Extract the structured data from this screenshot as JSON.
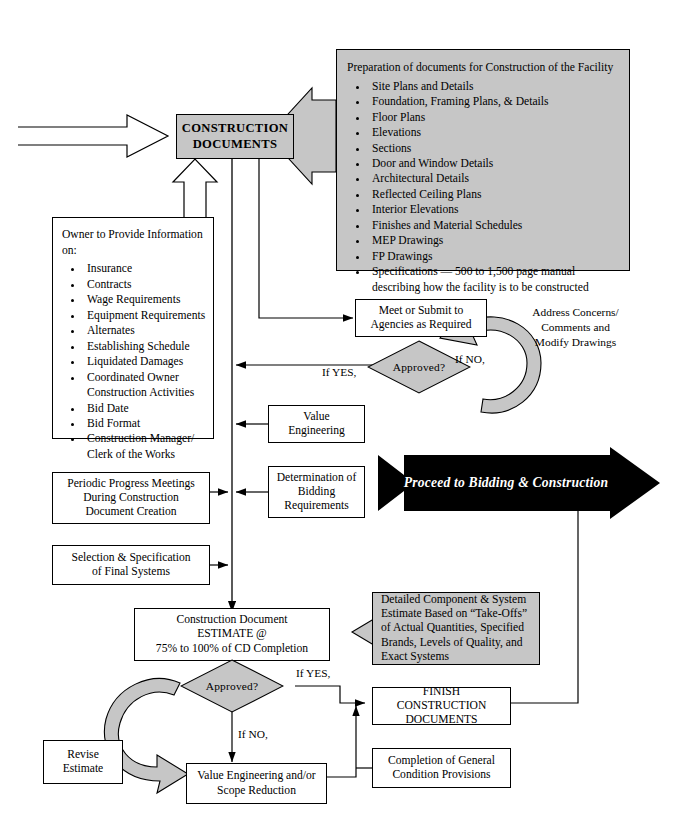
{
  "diagram": {
    "colors": {
      "fill_gray": "#c6c6c6",
      "stroke": "#000000",
      "arrow_black": "#000000",
      "page": "#ffffff"
    }
  },
  "nodes": {
    "construction_documents": {
      "label": "CONSTRUCTION\nDOCUMENTS",
      "line1": "CONSTRUCTION",
      "line2": "DOCUMENTS"
    },
    "preparation": {
      "heading": "Preparation of documents for Construction of the Facility",
      "items": [
        "Site Plans and Details",
        "Foundation, Framing Plans, & Details",
        "Floor Plans",
        "Elevations",
        "Sections",
        "Door and Window Details",
        "Architectural Details",
        "Reflected Ceiling Plans",
        "Interior Elevations",
        "Finishes and Material Schedules",
        "MEP Drawings",
        "FP Drawings",
        "Specifications — 500 to 1,500 page manual describing how the facility is to be constructed"
      ]
    },
    "owner_info": {
      "heading_line1": "Owner to Provide Information",
      "heading_line2": "on:",
      "items": [
        "Insurance",
        "Contracts",
        "Wage Requirements",
        "Equipment Requirements",
        "Alternates",
        "Establishing Schedule",
        "Liquidated Damages",
        "Coordinated Owner Construction Activities",
        "Bid Date",
        "Bid Format",
        "Construction Manager/ Clerk of the Works"
      ]
    },
    "meet_submit": {
      "line1": "Meet or Submit to",
      "line2": "Agencies as Required"
    },
    "approved_1": {
      "label": "Approved?"
    },
    "address_concerns": {
      "line1": "Address Concerns/",
      "line2": "Comments and",
      "line3": "Modify Drawings"
    },
    "value_engineering": {
      "line1": "Value",
      "line2": "Engineering"
    },
    "determination_bidding": {
      "line1": "Determination of",
      "line2": "Bidding",
      "line3": "Requirements"
    },
    "periodic_meetings": {
      "line1": "Periodic Progress Meetings",
      "line2": "During Construction",
      "line3": "Document Creation"
    },
    "selection_final_systems": {
      "line1": "Selection & Specification",
      "line2": "of Final Systems"
    },
    "cd_estimate": {
      "line1": "Construction Document",
      "line2": "ESTIMATE @",
      "line3": "75% to 100% of CD Completion"
    },
    "detailed_estimate": {
      "line1": "Detailed Component & System",
      "line2": "Estimate Based on “Take-Offs”",
      "line3": "of Actual Quantities, Specified",
      "line4": "Brands, Levels of Quality, and",
      "line5": "Exact Systems"
    },
    "approved_2": {
      "label": "Approved?"
    },
    "revise_estimate": {
      "line1": "Revise",
      "line2": "Estimate"
    },
    "value_eng_scope": {
      "line1": "Value Engineering and/or",
      "line2": "Scope Reduction"
    },
    "finish_cd": {
      "line1": "FINISH CONSTRUCTION",
      "line2": "DOCUMENTS"
    },
    "completion_general": {
      "line1": "Completion of General",
      "line2": "Condition Provisions"
    },
    "proceed_arrow": {
      "label": "Proceed to Bidding & Construction"
    }
  },
  "edge_labels": {
    "if_yes_1": "If YES,",
    "if_no_1": "If NO,",
    "if_yes_2": "If YES,",
    "if_no_2": "If NO,"
  }
}
